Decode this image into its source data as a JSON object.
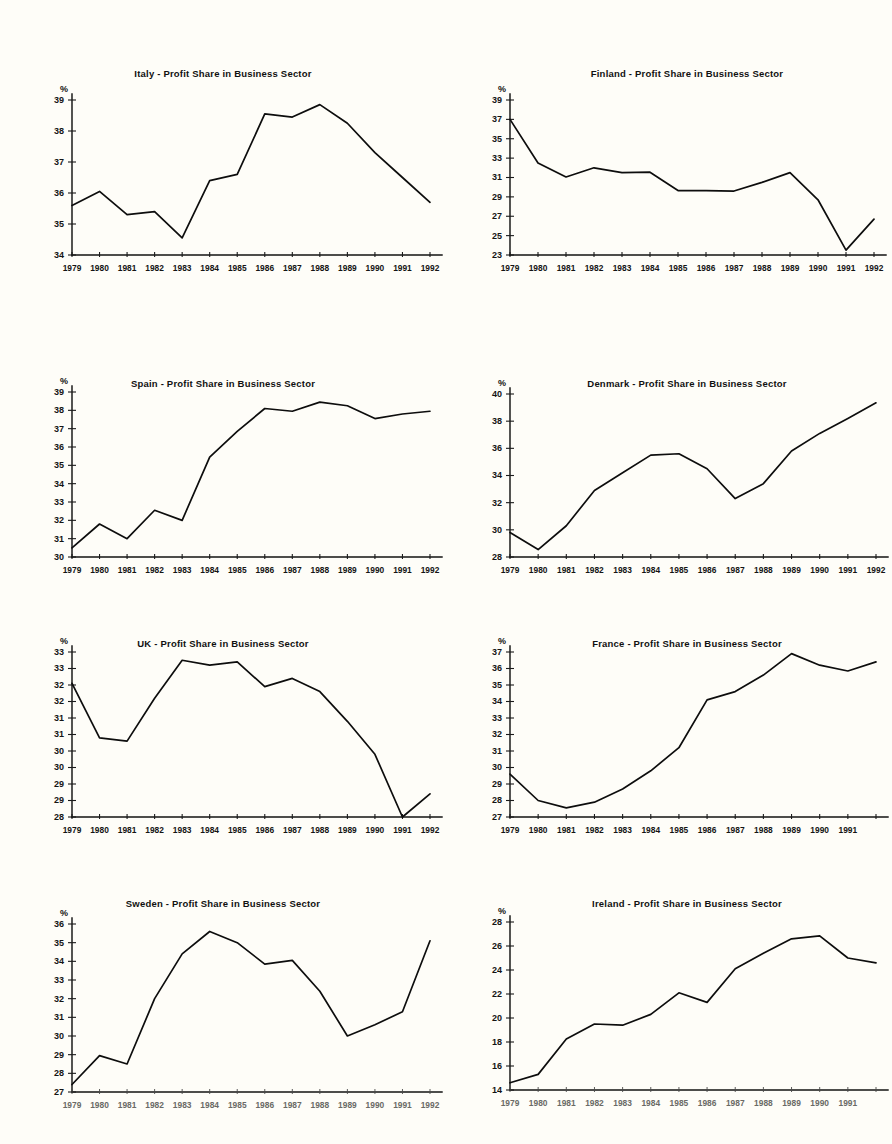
{
  "page": {
    "background": "#fefdf8",
    "ink": "#0d0d0d",
    "percent_symbol": "%"
  },
  "chart_data": [
    {
      "id": "italy",
      "type": "line",
      "title": "Italy - Profit Share in Business Sector",
      "xlabel": "",
      "ylabel": "%",
      "ylim": [
        34,
        39
      ],
      "yticks": [
        34,
        35,
        36,
        37,
        38,
        39
      ],
      "ytick_labels": [
        "34",
        "35",
        "36",
        "37",
        "38",
        "39"
      ],
      "grid": false,
      "legend": "none",
      "categories": [
        "1979",
        "1980",
        "1981",
        "1982",
        "1983",
        "1984",
        "1985",
        "1986",
        "1987",
        "1988",
        "1989",
        "1990",
        "1991",
        "1992"
      ],
      "values": [
        35.6,
        36.05,
        35.3,
        35.4,
        34.55,
        36.4,
        36.6,
        38.55,
        38.45,
        38.85,
        38.25,
        37.3,
        36.5,
        35.7
      ]
    },
    {
      "id": "finland",
      "type": "line",
      "title": "Finland - Profit Share in Business Sector",
      "xlabel": "",
      "ylabel": "%",
      "ylim": [
        23,
        39
      ],
      "yticks": [
        23,
        25,
        27,
        29,
        31,
        33,
        35,
        37,
        39
      ],
      "ytick_labels": [
        "23",
        "25",
        "27",
        "29",
        "31",
        "33",
        "35",
        "37",
        "39"
      ],
      "grid": false,
      "legend": "none",
      "categories": [
        "1979",
        "1980",
        "1981",
        "1982",
        "1983",
        "1984",
        "1985",
        "1986",
        "1987",
        "1988",
        "1989",
        "1990",
        "1991",
        "1992"
      ],
      "values": [
        37.0,
        32.5,
        31.05,
        32.0,
        31.5,
        31.55,
        29.65,
        29.65,
        29.6,
        30.5,
        31.5,
        28.7,
        23.5,
        26.7
      ]
    },
    {
      "id": "spain",
      "type": "line",
      "title": "Spain - Profit Share in Business Sector",
      "xlabel": "",
      "ylabel": "%",
      "ylim": [
        30,
        39
      ],
      "yticks": [
        30,
        31,
        32,
        33,
        34,
        35,
        36,
        37,
        38,
        39
      ],
      "ytick_labels": [
        "30",
        "31",
        "32",
        "33",
        "34",
        "35",
        "36",
        "37",
        "38",
        "39"
      ],
      "grid": false,
      "legend": "none",
      "categories": [
        "1979",
        "1980",
        "1981",
        "1982",
        "1983",
        "1984",
        "1985",
        "1986",
        "1987",
        "1988",
        "1989",
        "1990",
        "1991",
        "1992"
      ],
      "values": [
        30.5,
        31.8,
        31.0,
        32.55,
        32.0,
        35.45,
        36.85,
        38.1,
        37.95,
        38.45,
        38.25,
        37.55,
        37.8,
        37.95
      ]
    },
    {
      "id": "denmark",
      "type": "line",
      "title": "Denmark - Profit Share in Business Sector",
      "xlabel": "",
      "ylabel": "%",
      "ylim": [
        28,
        40
      ],
      "yticks": [
        28,
        30,
        32,
        34,
        36,
        38,
        40
      ],
      "ytick_labels": [
        "28",
        "30",
        "32",
        "34",
        "36",
        "38",
        "40"
      ],
      "grid": false,
      "legend": "none",
      "categories": [
        "1979",
        "1980",
        "1981",
        "1982",
        "1983",
        "1984",
        "1985",
        "1986",
        "1987",
        "1988",
        "1989",
        "1990",
        "1991",
        "1992"
      ],
      "values": [
        29.8,
        28.55,
        30.3,
        32.9,
        34.2,
        35.5,
        35.6,
        34.5,
        32.3,
        33.4,
        35.8,
        37.1,
        38.2,
        39.35
      ]
    },
    {
      "id": "uk",
      "type": "line",
      "title": "UK - Profit Share in Business Sector",
      "xlabel": "",
      "ylabel": "%",
      "ylim": [
        28,
        33
      ],
      "yticks": [
        28,
        28.5,
        29,
        29.5,
        30,
        30.5,
        31,
        31.5,
        32,
        32.5,
        33
      ],
      "ytick_labels": [
        "28",
        "29",
        "29",
        "30",
        "30",
        "31",
        "31",
        "32",
        "32",
        "33",
        "33"
      ],
      "grid": false,
      "legend": "none",
      "categories": [
        "1979",
        "1980",
        "1981",
        "1982",
        "1983",
        "1984",
        "1985",
        "1986",
        "1987",
        "1988",
        "1989",
        "1990",
        "1991",
        "1992"
      ],
      "values": [
        32.05,
        30.4,
        30.3,
        31.6,
        32.75,
        32.6,
        32.7,
        31.95,
        32.2,
        31.8,
        30.9,
        29.9,
        28.0,
        28.7
      ]
    },
    {
      "id": "france",
      "type": "line",
      "title": "France - Profit Share in Business Sector",
      "xlabel": "",
      "ylabel": "%",
      "ylim": [
        27,
        37
      ],
      "yticks": [
        27,
        28,
        29,
        30,
        31,
        32,
        33,
        34,
        35,
        36,
        37
      ],
      "ytick_labels": [
        "27",
        "28",
        "29",
        "30",
        "31",
        "32",
        "33",
        "34",
        "35",
        "36",
        "37"
      ],
      "grid": false,
      "legend": "none",
      "categories": [
        "1979",
        "1980",
        "1981",
        "1982",
        "1983",
        "1984",
        "1985",
        "1986",
        "1987",
        "1988",
        "1989",
        "1990",
        "1991",
        ""
      ],
      "values": [
        29.6,
        28.0,
        27.55,
        27.9,
        28.7,
        29.8,
        31.2,
        34.1,
        34.6,
        35.6,
        36.9,
        36.2,
        35.85,
        36.4
      ]
    },
    {
      "id": "sweden",
      "type": "line",
      "title": "Sweden - Profit Share in Business Sector",
      "xlabel": "",
      "ylabel": "%",
      "ylim": [
        27,
        36
      ],
      "yticks": [
        27,
        28,
        29,
        30,
        31,
        32,
        33,
        34,
        35,
        36
      ],
      "ytick_labels": [
        "27",
        "28",
        "29",
        "30",
        "31",
        "32",
        "33",
        "34",
        "35",
        "36"
      ],
      "grid": false,
      "legend": "none",
      "categories": [
        "1979",
        "1980",
        "1981",
        "1982",
        "1983",
        "1984",
        "1985",
        "1986",
        "1987",
        "1988",
        "1989",
        "1990",
        "1991",
        "1992"
      ],
      "values": [
        27.4,
        28.95,
        28.5,
        32.0,
        34.4,
        35.6,
        35.0,
        33.85,
        34.05,
        32.4,
        30.0,
        30.6,
        31.3,
        35.1
      ]
    },
    {
      "id": "ireland",
      "type": "line",
      "title": "Ireland - Profit Share in Business Sector",
      "xlabel": "",
      "ylabel": "%",
      "ylim": [
        14,
        28
      ],
      "yticks": [
        14,
        16,
        18,
        20,
        22,
        24,
        26,
        28
      ],
      "ytick_labels": [
        "14",
        "16",
        "18",
        "20",
        "22",
        "24",
        "26",
        "28"
      ],
      "grid": false,
      "legend": "none",
      "categories": [
        "1979",
        "1980",
        "1981",
        "1982",
        "1983",
        "1984",
        "1985",
        "1986",
        "1987",
        "1988",
        "1989",
        "1990",
        "1991",
        ""
      ],
      "values": [
        14.6,
        15.3,
        18.25,
        19.5,
        19.4,
        20.3,
        22.1,
        21.3,
        24.1,
        25.4,
        26.6,
        26.85,
        25.0,
        24.6
      ]
    }
  ]
}
